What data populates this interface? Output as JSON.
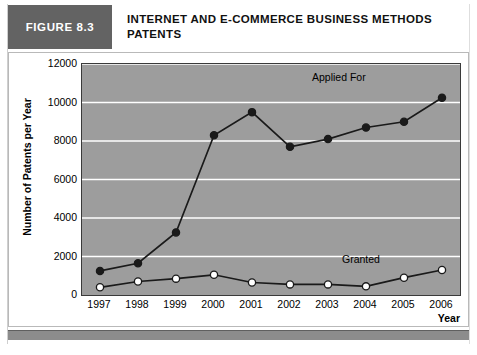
{
  "header": {
    "figure_tag": "FIGURE 8.3",
    "title_line1": "INTERNET AND E-COMMERCE BUSINESS METHODS",
    "title_line2": "PATENTS"
  },
  "colors": {
    "tag_background": "#636363",
    "tag_text": "#ffffff",
    "plot_background": "#9d9d9d",
    "gridline": "#ffffff",
    "series_applied_for": "#1a1a1a",
    "series_granted_fill": "#ffffff",
    "series_granted_stroke": "#1a1a1a",
    "bottom_bar": "#8c8c8c"
  },
  "chart_data": {
    "type": "line",
    "title": "INTERNET AND E-COMMERCE BUSINESS METHODS PATENTS",
    "xlabel": "Year",
    "ylabel": "Number of Patents per Year",
    "categories": [
      "1997",
      "1998",
      "1999",
      "2000",
      "2001",
      "2002",
      "2003",
      "2004",
      "2005",
      "2006"
    ],
    "x": [
      1997,
      1998,
      1999,
      2000,
      2001,
      2002,
      2003,
      2004,
      2005,
      2006
    ],
    "ylim": [
      0,
      12000
    ],
    "yticks": [
      0,
      2000,
      4000,
      6000,
      8000,
      10000,
      12000
    ],
    "ytick_labels": [
      "0",
      "2000",
      "4000",
      "6000",
      "8000",
      "10000",
      "12000"
    ],
    "grid": true,
    "grid_axis": "y",
    "legend": "inline-annotations",
    "series": [
      {
        "name": "Applied For",
        "marker": "filled-circle",
        "values": [
          1250,
          1650,
          3250,
          8300,
          9500,
          7700,
          8100,
          8700,
          9000,
          10250
        ]
      },
      {
        "name": "Granted",
        "marker": "open-circle",
        "values": [
          400,
          700,
          850,
          1050,
          650,
          550,
          550,
          450,
          900,
          1300
        ]
      }
    ],
    "annotations": [
      {
        "text": "Applied For",
        "series": "Applied For"
      },
      {
        "text": "Granted",
        "series": "Granted"
      }
    ]
  }
}
